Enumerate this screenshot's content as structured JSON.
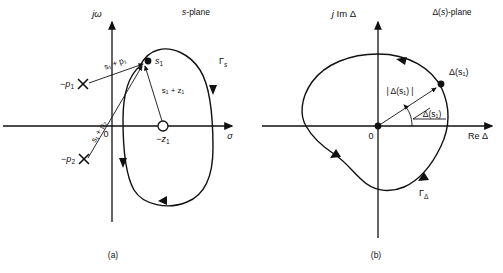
{
  "figure": {
    "panels": [
      {
        "id": "a",
        "caption": "(a)",
        "plane_title": "s-plane",
        "axes": {
          "imag_label": "jω",
          "real_label": "σ",
          "origin_label": "0"
        },
        "contour_label": "Γ",
        "contour_sub": "s",
        "contour_direction": "clockwise",
        "points": [
          {
            "name": "pole-1",
            "label": "−p",
            "sub": "1",
            "marker": "cross"
          },
          {
            "name": "pole-2",
            "label": "−p",
            "sub": "2",
            "marker": "cross"
          },
          {
            "name": "zero-1",
            "label": "−z",
            "sub": "1",
            "marker": "open-circle"
          },
          {
            "name": "test-point",
            "label": "s",
            "sub": "1",
            "marker": "filled-dot"
          }
        ],
        "vectors": [
          {
            "name": "vector-s1-plus-p1",
            "label": "s₁ + p₁",
            "from": "pole-1",
            "to": "test-point"
          },
          {
            "name": "vector-s1-plus-p2",
            "label": "s₁ + p₂",
            "from": "pole-2",
            "to": "test-point"
          },
          {
            "name": "vector-s1-plus-z1",
            "label": "s₁ + z₁",
            "from": "zero-1",
            "to": "test-point"
          }
        ]
      },
      {
        "id": "b",
        "caption": "(b)",
        "plane_title": "Δ(s)-plane",
        "axes": {
          "imag_label": "j Im Δ",
          "real_label": "Re Δ",
          "origin_label": "0"
        },
        "contour_label": "Γ",
        "contour_sub": "Δ",
        "contour_direction": "counterclockwise",
        "points": [
          {
            "name": "delta-s1-point",
            "label": "Δ(s₁)",
            "marker": "filled-dot"
          },
          {
            "name": "origin-point",
            "label": "0",
            "marker": "filled-dot"
          }
        ],
        "annotations": [
          {
            "name": "magnitude-label",
            "label": "| Δ(s₁) |"
          },
          {
            "name": "angle-label",
            "label": "Δ(s₁)",
            "prefix": "angle-symbol"
          }
        ]
      }
    ]
  },
  "colors": {
    "ink": "#111111",
    "background": "#ffffff"
  }
}
